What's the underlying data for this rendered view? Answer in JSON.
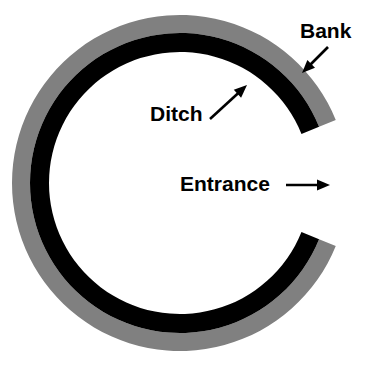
{
  "figure": {
    "background_color": "#ffffff"
  },
  "geometry": {
    "center_x": 180,
    "center_y": 183,
    "bank_outer_radius": 168,
    "bank_inner_radius": 150,
    "ditch_outer_radius": 150,
    "ditch_inner_radius": 131,
    "interior_radius": 131,
    "gap_start_angle_deg": -22,
    "gap_end_angle_deg": 22
  },
  "colors": {
    "bank": "#808080",
    "ditch": "#000000",
    "interior": "#ffffff",
    "label": "#000000",
    "arrow": "#000000"
  },
  "rings": [
    {
      "id": "bank-ring",
      "name": "Bank",
      "color": "#808080",
      "outer_radius": 168,
      "inner_radius": 150
    },
    {
      "id": "ditch-ring",
      "name": "Ditch",
      "color": "#000000",
      "outer_radius": 150,
      "inner_radius": 131
    }
  ],
  "annotations": [
    {
      "id": "bank",
      "label": "Bank",
      "text_x": 300,
      "text_y": 32,
      "arrow_from_x": 328,
      "arrow_from_y": 47,
      "arrow_to_x": 302,
      "arrow_to_y": 73,
      "points_to": "bank-ring"
    },
    {
      "id": "ditch",
      "label": "Ditch",
      "text_x": 150,
      "text_y": 115,
      "arrow_from_x": 210,
      "arrow_from_y": 119,
      "arrow_to_x": 247,
      "arrow_to_y": 85,
      "points_to": "ditch-ring"
    },
    {
      "id": "entrance",
      "label": "Entrance",
      "text_x": 180,
      "text_y": 185,
      "arrow_from_x": 286,
      "arrow_from_y": 185,
      "arrow_to_x": 330,
      "arrow_to_y": 185,
      "points_to": "entrance-gap"
    }
  ],
  "footer": {
    "artifact_text": ""
  }
}
